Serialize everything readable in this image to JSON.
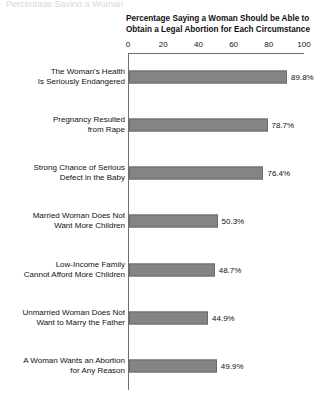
{
  "top_cutoff_text": "Percentage Saying a Woman",
  "chart_data": {
    "type": "bar",
    "orientation": "horizontal",
    "title": "Percentage Saying a Woman Should be Able to Obtain a Legal Abortion for Each Circumstance",
    "title_lines": [
      "Percentage Saying a Woman Should be Able to",
      "Obtain a Legal Abortion for Each Circumstance"
    ],
    "xlabel": "",
    "ylabel": "",
    "xlim": [
      0,
      100
    ],
    "xticks": [
      0,
      20,
      40,
      60,
      80,
      100
    ],
    "xtick_labels": [
      "0",
      "20",
      "40",
      "60",
      "80",
      "100"
    ],
    "grid": false,
    "legend": false,
    "bar_color": "#848484",
    "bar_edge_color": "#6b6b6b",
    "axis_color": "#6e6e6e",
    "categories": [
      "The Woman's Health Is Seriously Endangered",
      "Pregnancy Resulted from Rape",
      "Strong Chance of Serious Defect in the Baby",
      "Married Woman Does Not Want More Children",
      "Low-Income Family Cannot Afford More Children",
      "Unmarried Woman Does Not Want to Marry the Father",
      "A Woman Wants an Abortion for Any Reason"
    ],
    "category_lines": [
      [
        "The Woman's Health",
        "Is Seriously Endangered"
      ],
      [
        "Pregnancy Resulted",
        "from Rape"
      ],
      [
        "Strong Chance of Serious",
        "Defect in the Baby"
      ],
      [
        "Married Woman Does Not",
        "Want More Children"
      ],
      [
        "Low-Income Family",
        "Cannot Afford More Children"
      ],
      [
        "Unmarried Woman Does Not",
        "Want to Marry the Father"
      ],
      [
        "A Woman Wants an Abortion",
        "for Any Reason"
      ]
    ],
    "values": [
      89.8,
      78.7,
      76.4,
      50.3,
      48.7,
      44.9,
      49.9
    ],
    "value_labels": [
      "89.8%",
      "78.7%",
      "76.4%",
      "50.3%",
      "48.7%",
      "44.9%",
      "49.9%"
    ]
  }
}
